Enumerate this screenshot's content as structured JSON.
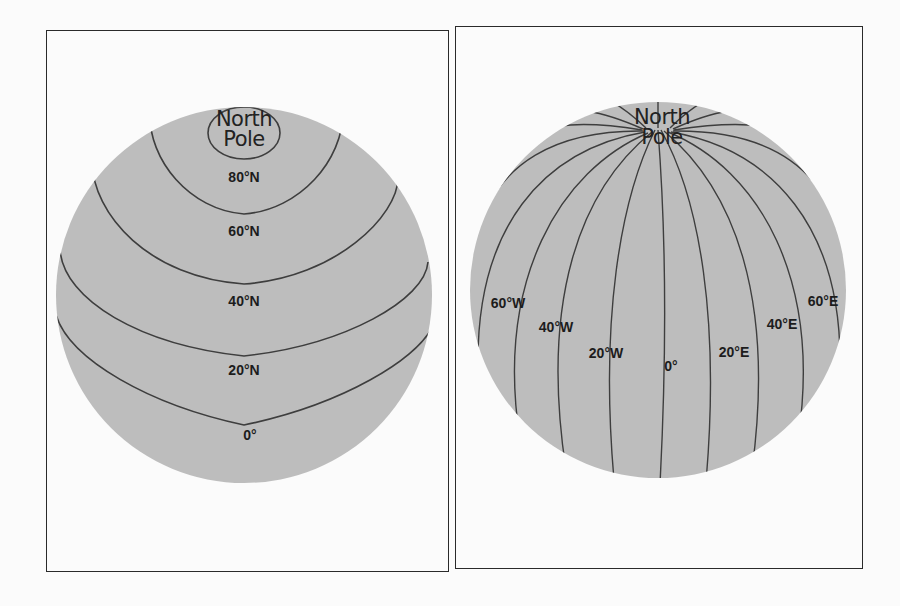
{
  "colors": {
    "globe_fill": "#bdbdbd",
    "line": "#3e3e3e",
    "frame": "#2a2a2a",
    "background": "#fbfbfb",
    "text": "#1c1c1c"
  },
  "left_panel": {
    "title": "Lines of latitude (parallels)",
    "pole_label_line1": "North",
    "pole_label_line2": "Pole",
    "globe": {
      "cx": 244,
      "cy": 295,
      "r": 188
    },
    "parallels": [
      {
        "label": "80°N",
        "label_x": 244,
        "label_y": 172
      },
      {
        "label": "60°N",
        "label_x": 244,
        "label_y": 231
      },
      {
        "label": "40°N",
        "label_x": 244,
        "label_y": 301
      },
      {
        "label": "20°N",
        "label_x": 244,
        "label_y": 370
      },
      {
        "label": "0°",
        "label_x": 244,
        "label_y": 435
      }
    ]
  },
  "right_panel": {
    "title": "Lines of longitude (meridians)",
    "pole_label_line1": "North",
    "pole_label_line2": "Pole",
    "globe": {
      "cx": 658,
      "cy": 290,
      "r": 188
    },
    "meridians": [
      {
        "label": "60°W",
        "label_x": 508,
        "label_y": 303
      },
      {
        "label": "40°W",
        "label_x": 556,
        "label_y": 327
      },
      {
        "label": "20°W",
        "label_x": 606,
        "label_y": 353
      },
      {
        "label": "0°",
        "label_x": 671,
        "label_y": 366
      },
      {
        "label": "20°E",
        "label_x": 734,
        "label_y": 352
      },
      {
        "label": "40°E",
        "label_x": 782,
        "label_y": 324
      },
      {
        "label": "60°E",
        "label_x": 823,
        "label_y": 301
      }
    ]
  }
}
